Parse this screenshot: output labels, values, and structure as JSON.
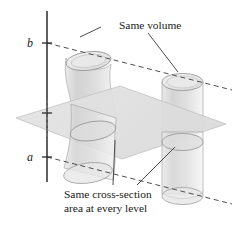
{
  "figure": {
    "background_color": "#ffffff",
    "width": 240,
    "height": 227,
    "annotations": {
      "top_label": "Same volume",
      "bottom_label_line1": "Same cross-section",
      "bottom_label_line2": "area at every level",
      "axis_upper_tick": "b",
      "axis_lower_tick": "a"
    },
    "colors": {
      "ink": "#1a1a1a",
      "solid_fill": "#d8d8d8",
      "solid_fill_light": "#e6e6e6",
      "solid_stroke": "#9a9a9a",
      "plane_fill": "#e2e2e2",
      "plane_stroke": "#c2c2c2",
      "dash_stroke": "#4d4d4d",
      "leader_stroke": "#3a3a3a",
      "axis_stroke": "#2b2b2b"
    },
    "elements": {
      "vertical_axis": "vertical measuring axis with ticks at a and b",
      "left_solid": "warped curved cylinder (oblique S-shaped solid)",
      "right_solid": "straight right circular cylinder",
      "cutting_plane": "horizontal cutting plane parallelogram",
      "upper_dashed_level": "dashed level line through b",
      "lower_dashed_level": "dashed level line through a"
    }
  }
}
